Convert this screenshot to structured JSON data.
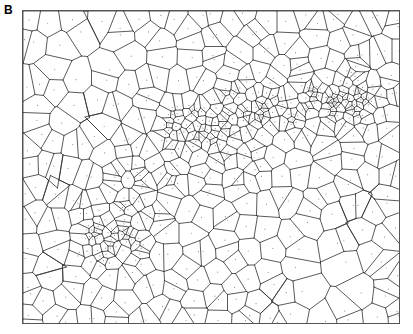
{
  "figure": {
    "panel_label": "B",
    "type": "voronoi-diagram"
  },
  "frame": {
    "x": 22,
    "y": 10,
    "width": 378,
    "height": 314,
    "border_color": "#555555",
    "background_color": "#ffffff"
  },
  "style": {
    "edge_color": "#303030",
    "edge_width": 0.8,
    "seed_color": "#909090",
    "seed_radius": 0.6,
    "show_seeds": true
  },
  "chart_data": {
    "type": "diagram",
    "title": "",
    "subtitle": "",
    "xlabel": "",
    "ylabel": "",
    "grid": false,
    "legend": null,
    "plot_width": 378,
    "plot_height": 314,
    "point_count": 620,
    "density_field": {
      "background_density": 0.06,
      "clusters": [
        {
          "name": "core-band-center",
          "cx": 200,
          "cy": 120,
          "sigma_x": 62,
          "sigma_y": 34,
          "rotation_deg": -22,
          "weight": 1.0
        },
        {
          "name": "core-band-left",
          "cx": 120,
          "cy": 175,
          "sigma_x": 55,
          "sigma_y": 40,
          "rotation_deg": -18,
          "weight": 0.82
        },
        {
          "name": "core-band-right",
          "cx": 262,
          "cy": 100,
          "sigma_x": 48,
          "sigma_y": 32,
          "rotation_deg": -26,
          "weight": 0.78
        },
        {
          "name": "dense-nucleus",
          "cx": 196,
          "cy": 112,
          "sigma_x": 26,
          "sigma_y": 15,
          "rotation_deg": -20,
          "weight": 0.95
        },
        {
          "name": "upper-right-cluster",
          "cx": 323,
          "cy": 86,
          "sigma_x": 34,
          "sigma_y": 30,
          "rotation_deg": 0,
          "weight": 0.7
        },
        {
          "name": "upper-right-nucleus",
          "cx": 324,
          "cy": 88,
          "sigma_x": 16,
          "sigma_y": 14,
          "rotation_deg": 0,
          "weight": 0.55
        },
        {
          "name": "lower-left-cluster",
          "cx": 86,
          "cy": 212,
          "sigma_x": 40,
          "sigma_y": 38,
          "rotation_deg": 0,
          "weight": 0.68
        },
        {
          "name": "lower-left-nucleus",
          "cx": 92,
          "cy": 218,
          "sigma_x": 20,
          "sigma_y": 18,
          "rotation_deg": 0,
          "weight": 0.48
        }
      ],
      "sparse_regions": [
        {
          "name": "upper-left-void",
          "cx": 50,
          "cy": 50
        },
        {
          "name": "lower-right-void",
          "cx": 300,
          "cy": 270
        }
      ]
    },
    "observed_features": [
      "dense diagonal band of small polygons from lower-left to upper-right",
      "long straight radiating edges into the upper-left empty region",
      "long thin elongated cells fanning into the lower-right empty region",
      "secondary compact cluster near the upper-right",
      "secondary compact cluster near the lower-left",
      "small seed dots visible inside many cells"
    ]
  }
}
